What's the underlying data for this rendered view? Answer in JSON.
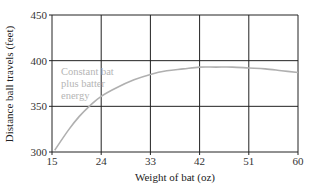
{
  "chart_data": {
    "type": "line",
    "title": "",
    "xlabel": "Weight of bat (oz)",
    "ylabel": "Distance ball travels (feet)",
    "xlim": [
      15,
      60
    ],
    "ylim": [
      300,
      450
    ],
    "x_ticks": [
      "15",
      "24",
      "33",
      "42",
      "51",
      "60"
    ],
    "y_ticks": [
      "300",
      "350",
      "400",
      "450"
    ],
    "grid": true,
    "legend": null,
    "annotation": [
      "Constant bat",
      "plus batter",
      "energy"
    ],
    "series": [
      {
        "name": "Constant bat plus batter energy",
        "color": "#b0b0b0",
        "x": [
          15.5,
          18,
          20,
          22,
          24,
          27,
          30,
          33,
          36,
          39,
          42,
          45,
          48,
          51,
          54,
          57,
          60
        ],
        "values": [
          302,
          324,
          339,
          351,
          361,
          371,
          379,
          385,
          389,
          391,
          393,
          393,
          393,
          392,
          391,
          389,
          387
        ]
      }
    ]
  },
  "labels": {
    "annotation_line1": "Constant bat",
    "annotation_line2": "plus batter",
    "annotation_line3": "energy",
    "xlabel": "Weight of bat (oz)",
    "ylabel": "Distance ball travels (feet)",
    "x_ticks": [
      "15",
      "24",
      "33",
      "42",
      "51",
      "60"
    ],
    "y_ticks": [
      "300",
      "350",
      "400",
      "450"
    ]
  }
}
